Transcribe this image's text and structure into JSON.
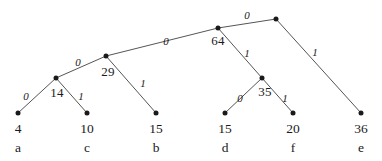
{
  "figure": {
    "type": "huffman-tree-diagram",
    "background_color": "#ffffff",
    "ink_color": "#1a1a1a",
    "edge_color": "#555555"
  },
  "chart_data": {
    "type": "diagram",
    "title": "",
    "xlabel": "",
    "ylabel": "",
    "nodes": [
      {
        "id": "root",
        "label": "",
        "x": 276,
        "y": 19,
        "kind": "internal"
      },
      {
        "id": "n64",
        "label": "64",
        "x": 218,
        "y": 28,
        "kind": "internal"
      },
      {
        "id": "n29",
        "label": "29",
        "x": 106,
        "y": 56,
        "kind": "internal"
      },
      {
        "id": "n14",
        "label": "14",
        "x": 56,
        "y": 78,
        "kind": "internal"
      },
      {
        "id": "n35",
        "label": "35",
        "x": 262,
        "y": 78,
        "kind": "internal"
      },
      {
        "id": "la",
        "label": "4",
        "x": 18,
        "y": 113,
        "kind": "leaf",
        "symbol": "a"
      },
      {
        "id": "lc",
        "label": "10",
        "x": 87,
        "y": 113,
        "kind": "leaf",
        "symbol": "c"
      },
      {
        "id": "lb",
        "label": "15",
        "x": 156,
        "y": 113,
        "kind": "leaf",
        "symbol": "b"
      },
      {
        "id": "ld",
        "label": "15",
        "x": 225,
        "y": 113,
        "kind": "leaf",
        "symbol": "d"
      },
      {
        "id": "lf",
        "label": "20",
        "x": 293,
        "y": 113,
        "kind": "leaf",
        "symbol": "f"
      },
      {
        "id": "le",
        "label": "36",
        "x": 361,
        "y": 113,
        "kind": "leaf",
        "symbol": "e"
      }
    ],
    "edges": [
      {
        "from": "root",
        "to": "n64",
        "label": "0",
        "label_x": 247,
        "label_y": 15
      },
      {
        "from": "root",
        "to": "le",
        "label": "1",
        "label_x": 315,
        "label_y": 52
      },
      {
        "from": "n64",
        "to": "n29",
        "label": "0",
        "label_x": 166,
        "label_y": 41
      },
      {
        "from": "n64",
        "to": "n35",
        "label": "1",
        "label_x": 247,
        "label_y": 53
      },
      {
        "from": "n29",
        "to": "n14",
        "label": "0",
        "label_x": 78,
        "label_y": 62
      },
      {
        "from": "n29",
        "to": "lb",
        "label": "1",
        "label_x": 143,
        "label_y": 83
      },
      {
        "from": "n14",
        "to": "la",
        "label": "0",
        "label_x": 26,
        "label_y": 96
      },
      {
        "from": "n14",
        "to": "lc",
        "label": "1",
        "label_x": 81,
        "label_y": 96
      },
      {
        "from": "n35",
        "to": "ld",
        "label": "0",
        "label_x": 240,
        "label_y": 98
      },
      {
        "from": "n35",
        "to": "lf",
        "label": "1",
        "label_x": 285,
        "label_y": 98
      }
    ],
    "internal_weight_labels": [
      {
        "for": "n64",
        "text": "64",
        "x": 218,
        "y": 41
      },
      {
        "for": "n29",
        "text": "29",
        "x": 108,
        "y": 72
      },
      {
        "for": "n14",
        "text": "14",
        "x": 57,
        "y": 93
      },
      {
        "for": "n35",
        "text": "35",
        "x": 265,
        "y": 92
      }
    ],
    "leaf_value_labels": [
      {
        "for": "la",
        "text": "4",
        "x": 18,
        "y": 129
      },
      {
        "for": "lc",
        "text": "10",
        "x": 87,
        "y": 129
      },
      {
        "for": "lb",
        "text": "15",
        "x": 156,
        "y": 129
      },
      {
        "for": "ld",
        "text": "15",
        "x": 225,
        "y": 129
      },
      {
        "for": "lf",
        "text": "20",
        "x": 293,
        "y": 129
      },
      {
        "for": "le",
        "text": "36",
        "x": 361,
        "y": 129
      }
    ],
    "leaf_symbol_labels": [
      {
        "for": "la",
        "text": "a",
        "x": 18,
        "y": 148
      },
      {
        "for": "lc",
        "text": "c",
        "x": 87,
        "y": 148
      },
      {
        "for": "lb",
        "text": "b",
        "x": 156,
        "y": 148
      },
      {
        "for": "ld",
        "text": "d",
        "x": 225,
        "y": 148
      },
      {
        "for": "lf",
        "text": "f",
        "x": 293,
        "y": 148
      },
      {
        "for": "le",
        "text": "e",
        "x": 361,
        "y": 148
      }
    ]
  }
}
